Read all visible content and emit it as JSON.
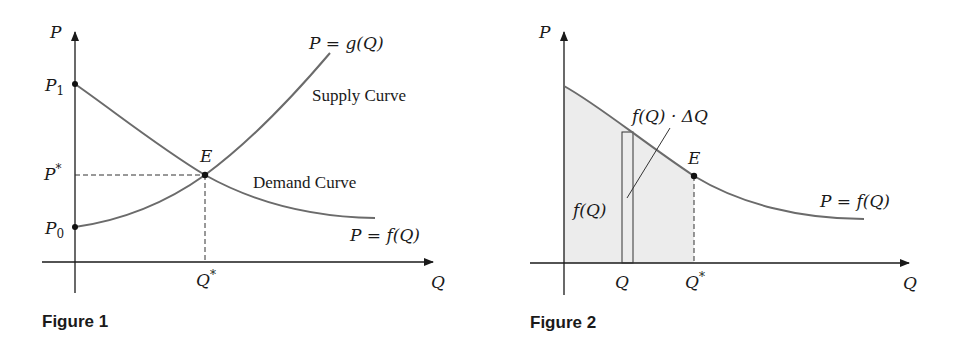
{
  "figure1": {
    "caption": "Figure 1",
    "axes": {
      "y_label": "P",
      "x_label": "Q"
    },
    "y_ticks": {
      "p1": "P",
      "p1_sub": "1",
      "pstar": "P",
      "pstar_sup": "*",
      "p0": "P",
      "p0_sub": "0"
    },
    "x_ticks": {
      "qstar": "Q",
      "qstar_sup": "*"
    },
    "point_label": "E",
    "supply": {
      "equation": "P = g(Q)",
      "label": "Supply Curve"
    },
    "demand": {
      "equation": "P = f(Q)",
      "label": "Demand Curve"
    },
    "colors": {
      "curve": "#6b6b6b",
      "axis": "#1a1a1a"
    }
  },
  "figure2": {
    "caption": "Figure 2",
    "axes": {
      "y_label": "P",
      "x_label": "Q"
    },
    "x_ticks": {
      "q": "Q",
      "qstar": "Q",
      "qstar_sup": "*"
    },
    "point_label": "E",
    "demand": {
      "equation": "P = f(Q)"
    },
    "strip_label": "f(Q) · ΔQ",
    "height_label": "f(Q)",
    "colors": {
      "curve": "#6b6b6b",
      "shade": "#ececec",
      "axis": "#1a1a1a"
    }
  }
}
